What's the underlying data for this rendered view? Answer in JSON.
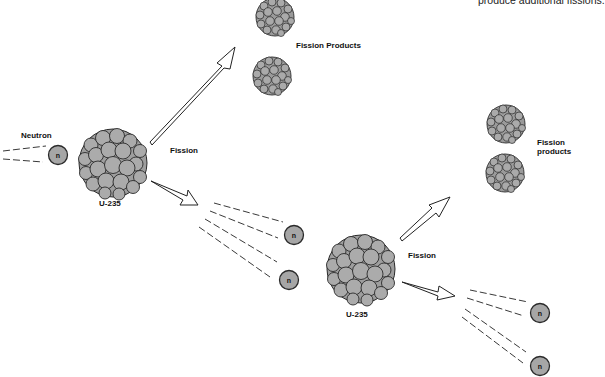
{
  "caption": {
    "top_right_text": "produce additional fissions."
  },
  "labels": {
    "neutron": "Neutron",
    "fission_1": "Fission",
    "u235_1": "U-235",
    "fission_products_1": "Fission Products",
    "fission_2": "Fission",
    "u235_2": "U-235",
    "fission_products_2_line1": "Fission",
    "fission_products_2_line2": "products",
    "neutron_symbol": "n"
  },
  "colors": {
    "nucleon_fill": "#a9a9a9",
    "nucleon_stroke": "#2a2a2a",
    "neutron_fill": "#a6a6a6",
    "line": "#222222",
    "background": "#ffffff"
  },
  "diagram": {
    "nodes": [
      {
        "id": "incoming-neutron",
        "type": "neutron",
        "label": "n",
        "caption": "Neutron"
      },
      {
        "id": "u235-a",
        "type": "nucleus",
        "caption": "U-235"
      },
      {
        "id": "products-a",
        "type": "fission-products",
        "caption": "Fission Products"
      },
      {
        "id": "neutron-a1",
        "type": "neutron",
        "label": "n"
      },
      {
        "id": "neutron-a2",
        "type": "neutron",
        "label": "n"
      },
      {
        "id": "u235-b",
        "type": "nucleus",
        "caption": "U-235"
      },
      {
        "id": "products-b",
        "type": "fission-products",
        "caption": "Fission products"
      },
      {
        "id": "neutron-b1",
        "type": "neutron",
        "label": "n"
      },
      {
        "id": "neutron-b2",
        "type": "neutron",
        "label": "n"
      }
    ],
    "edges": [
      {
        "from": "incoming-neutron",
        "to": "u235-a",
        "style": "dashed-trail"
      },
      {
        "from": "u235-a",
        "to": "products-a",
        "style": "hollow-arrow",
        "label": "Fission"
      },
      {
        "from": "u235-a",
        "to": "neutron-a1",
        "style": "hollow-arrow"
      },
      {
        "from": "u235-a",
        "to": "neutron-a2",
        "style": "hollow-arrow"
      },
      {
        "from": "neutron-a2",
        "to": "u235-b",
        "style": "dashed-trail"
      },
      {
        "from": "u235-b",
        "to": "products-b",
        "style": "hollow-arrow",
        "label": "Fission"
      },
      {
        "from": "u235-b",
        "to": "neutron-b1",
        "style": "hollow-arrow"
      },
      {
        "from": "u235-b",
        "to": "neutron-b2",
        "style": "hollow-arrow"
      }
    ]
  }
}
